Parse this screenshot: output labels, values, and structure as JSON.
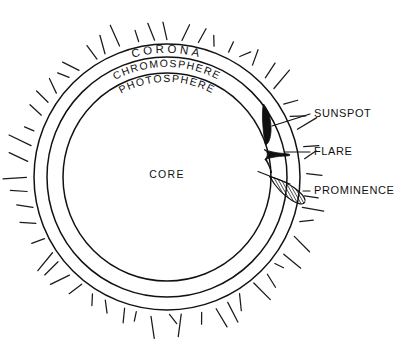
{
  "diagram": {
    "background_color": "#ffffff",
    "ink_color": "#111111",
    "center": {
      "x": 167,
      "y": 177
    },
    "layers": [
      {
        "key": "corona",
        "label": "CORONA",
        "radius": 133,
        "label_radius": 124
      },
      {
        "key": "chromosphere",
        "label": "CHROMOSPHERE",
        "radius": 120,
        "label_radius": 110
      },
      {
        "key": "photosphere",
        "label": "PHOTOSPHERE",
        "radius": 104,
        "label_radius": 95
      },
      {
        "key": "core",
        "label": "CORE",
        "radius": 0,
        "label_radius": 0
      }
    ],
    "core": {
      "label": "CORE",
      "label_x": 167,
      "label_y": 178
    },
    "corona_rays": {
      "count": 56,
      "inner_radius": 137,
      "min_length": 9,
      "max_length": 24,
      "description": "short radial strokes radiating outward from the outer corona circle"
    },
    "features": [
      {
        "key": "sunspot",
        "label": "SUNSPOT",
        "shape": "dark elongated lens in the photosphere shell",
        "label_x": 314,
        "label_y": 117,
        "leader_from": {
          "x": 272,
          "y": 126
        },
        "leader_to": {
          "x": 310,
          "y": 114
        }
      },
      {
        "key": "flare",
        "label": "FLARE",
        "shape": "dark bowtie erupting outward through the chromosphere",
        "label_x": 314,
        "label_y": 155,
        "leader_from": {
          "x": 285,
          "y": 152
        },
        "leader_to": {
          "x": 310,
          "y": 152
        }
      },
      {
        "key": "prominence",
        "label": "PROMINENCE",
        "shape": "hatched arching loop extending beyond the corona edge",
        "label_x": 314,
        "label_y": 194,
        "leader_from": {
          "x": 303,
          "y": 191
        },
        "leader_to": {
          "x": 310,
          "y": 191
        }
      }
    ]
  }
}
